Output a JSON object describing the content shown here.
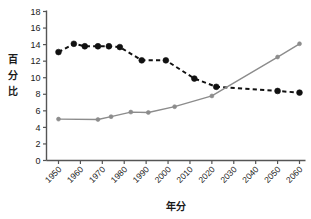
{
  "chart_data": {
    "type": "line",
    "title": "",
    "xlabel": "年分",
    "ylabel": "百分比",
    "xlim": [
      1950,
      2060
    ],
    "ylim": [
      0,
      18
    ],
    "ytick_step": 2,
    "grid": false,
    "legend": "none",
    "xticks": [
      "1950",
      "1960",
      "1970",
      "1980",
      "1990",
      "2000",
      "2010",
      "2020",
      "2030",
      "2040",
      "2050",
      "2060"
    ],
    "yticks": [
      "0",
      "2",
      "4",
      "6",
      "8",
      "10",
      "12",
      "14",
      "16",
      "18"
    ],
    "series": [
      {
        "name": "series-dashed-black",
        "style": "dashed",
        "color": "#111111",
        "marker": "circle-large",
        "x": [
          1950,
          1957,
          1962,
          1968,
          1973,
          1978,
          1988,
          1999,
          2012,
          2022,
          2050,
          2060
        ],
        "values": [
          13.1,
          14.1,
          13.8,
          13.8,
          13.8,
          13.7,
          12.1,
          12.1,
          9.9,
          8.9,
          8.4,
          8.2
        ]
      },
      {
        "name": "series-solid-gray",
        "style": "solid",
        "color": "#8c8c8c",
        "marker": "circle-small",
        "x": [
          1950,
          1968,
          1974,
          1983,
          1991,
          2003,
          2020,
          2050,
          2060
        ],
        "values": [
          5.0,
          4.95,
          5.3,
          5.85,
          5.8,
          6.5,
          7.8,
          12.5,
          14.1
        ]
      }
    ]
  },
  "axes": {
    "ylabel_chars": [
      "百",
      "分",
      "比"
    ],
    "xlabel": "年分"
  }
}
